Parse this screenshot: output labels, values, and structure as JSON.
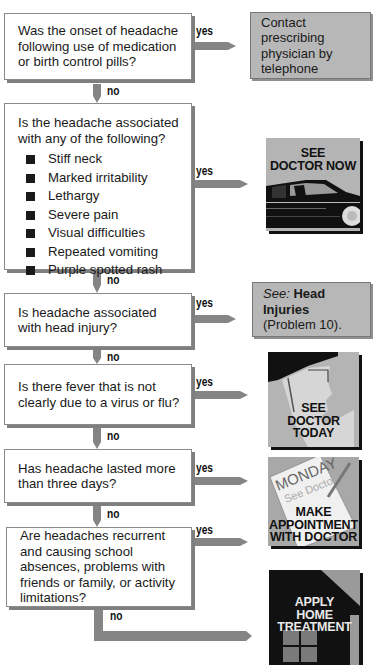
{
  "flowchart": {
    "colors": {
      "arrow": "#858585",
      "result_box": "#b7b7b7",
      "question_shadow": "#7f7f7f",
      "bullet": "#1a1a1a"
    },
    "branch_labels": {
      "yes": "yes",
      "no": "no"
    },
    "questions": [
      {
        "id": "q1",
        "text": "Was the onset of headache following use of medication or birth control pills?"
      },
      {
        "id": "q2",
        "text": "Is the headache associated with any of the following?",
        "bullets": [
          "Stiff neck",
          "Marked irritability",
          "Lethargy",
          "Severe pain",
          "Visual difficulties",
          "Repeated vomiting",
          "Purple spotted rash"
        ]
      },
      {
        "id": "q3",
        "text": "Is headache associated with head injury?"
      },
      {
        "id": "q4",
        "text": "Is there fever that is not clearly due to a virus or flu?"
      },
      {
        "id": "q5",
        "text": "Has headache lasted more than three days?"
      },
      {
        "id": "q6",
        "text": "Are headaches recurrent and causing school absences, problems with friends or family, or activity limitations?"
      }
    ],
    "outcomes": [
      {
        "id": "o1",
        "type": "text-box",
        "text": "Contact prescribing physician by telephone"
      },
      {
        "id": "o2",
        "type": "picture",
        "icon": "car-icon",
        "caption_line1": "SEE",
        "caption_line2": "DOCTOR NOW"
      },
      {
        "id": "o3",
        "type": "text-box",
        "see_prefix": "See:",
        "see_title": "Head Injuries",
        "see_ref": "(Problem 10)."
      },
      {
        "id": "o4",
        "type": "picture",
        "icon": "thermometer-face-icon",
        "caption_line1": "SEE",
        "caption_line2": "DOCTOR",
        "caption_line3": "TODAY"
      },
      {
        "id": "o5",
        "type": "picture",
        "icon": "calendar-note-icon",
        "note_day": "MONDAY",
        "note_text": "See Doctor",
        "caption_line1": "MAKE",
        "caption_line2": "APPOINTMENT",
        "caption_line3": "WITH DOCTOR"
      },
      {
        "id": "o6",
        "type": "picture",
        "icon": "house-icon",
        "caption_line1": "APPLY",
        "caption_line2": "HOME",
        "caption_line3": "TREATMENT"
      }
    ]
  }
}
